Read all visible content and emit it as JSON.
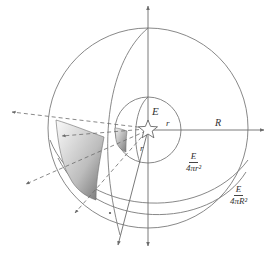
{
  "figure": {
    "header_faint_text": "",
    "caption_faint_text": "",
    "labels": {
      "source": "E",
      "small_radius_h": "r",
      "small_radius_diag": "r",
      "large_radius": "R"
    },
    "inner_flux": {
      "numerator": "E",
      "denominator": "4πr²"
    },
    "outer_flux": {
      "numerator": "E",
      "denominator": "4πR²"
    }
  },
  "colors": {
    "stroke": "#6b6b6b",
    "patch_dark": "#8a8a8a",
    "patch_light": "#f4f4f4",
    "text": "#333333"
  }
}
